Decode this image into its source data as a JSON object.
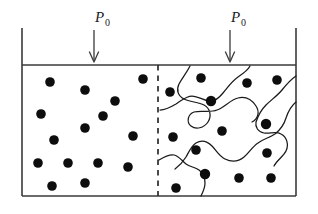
{
  "figure": {
    "background_color": "#ffffff",
    "line_color": "#333333",
    "particle_color": "#0d0d0d",
    "chain_color": "#1a1a1a",
    "width": 318,
    "height": 214
  },
  "labels": {
    "left_pressure": {
      "symbol": "P",
      "subscript": "0",
      "x": 95,
      "y": 22
    },
    "right_pressure": {
      "symbol": "P",
      "subscript": "0",
      "x": 231,
      "y": 22
    }
  },
  "arrows": [
    {
      "name": "left-pressure-arrow",
      "x": 94,
      "y_start": 30,
      "y_end": 62
    },
    {
      "name": "right-pressure-arrow",
      "x": 230,
      "y_start": 30,
      "y_end": 62
    }
  ],
  "container": {
    "left_wall_x": 22,
    "right_wall_x": 296,
    "wall_top_y": 28,
    "fluid_top_y": 65,
    "bottom_y": 196
  },
  "membrane": {
    "name": "dashed-membrane",
    "x": 158,
    "y_start": 65,
    "y_end": 196,
    "style": "dashed"
  },
  "left_chamber": {
    "name": "solvent-chamber",
    "particle_count": 15,
    "particles": [
      {
        "cx": 50,
        "cy": 82
      },
      {
        "cx": 85,
        "cy": 90
      },
      {
        "cx": 143,
        "cy": 79
      },
      {
        "cx": 115,
        "cy": 101
      },
      {
        "cx": 41,
        "cy": 114
      },
      {
        "cx": 103,
        "cy": 116
      },
      {
        "cx": 85,
        "cy": 141
      },
      {
        "cx": 133,
        "cy": 136
      },
      {
        "cx": 54,
        "cy": 140
      },
      {
        "cx": 38,
        "cy": 163
      },
      {
        "cx": 52,
        "cy": 186
      },
      {
        "cx": 68,
        "cy": 163
      },
      {
        "cx": 98,
        "cy": 163
      },
      {
        "cx": 128,
        "cy": 167
      },
      {
        "cx": 85,
        "cy": 183
      }
    ]
  },
  "right_chamber": {
    "name": "polymer-solution-chamber",
    "particle_count": 16,
    "particles": [
      {
        "cx": 201,
        "cy": 78
      },
      {
        "cx": 247,
        "cy": 83
      },
      {
        "cx": 277,
        "cy": 80
      },
      {
        "cx": 170,
        "cy": 92
      },
      {
        "cx": 211,
        "cy": 101
      },
      {
        "cx": 266,
        "cy": 124
      },
      {
        "cx": 222,
        "cy": 131
      },
      {
        "cx": 173,
        "cy": 137
      },
      {
        "cx": 196,
        "cy": 150
      },
      {
        "cx": 267,
        "cy": 153
      },
      {
        "cx": 207,
        "cy": 176
      },
      {
        "cx": 239,
        "cy": 178
      },
      {
        "cx": 271,
        "cy": 178
      },
      {
        "cx": 176,
        "cy": 188
      },
      {
        "cx": 205,
        "cy": 175
      },
      {
        "cx": 206,
        "cy": 177
      }
    ],
    "chain_count": 5,
    "chains": [
      "polymer-chain-1",
      "polymer-chain-2",
      "polymer-chain-3",
      "polymer-chain-4",
      "polymer-chain-5"
    ]
  }
}
